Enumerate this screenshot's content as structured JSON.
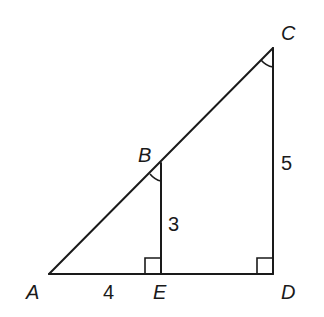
{
  "diagram": {
    "type": "similar-right-triangles",
    "points": {
      "A": {
        "label": "A",
        "x": 49,
        "y": 274
      },
      "E": {
        "label": "E",
        "x": 161,
        "y": 274
      },
      "D": {
        "label": "D",
        "x": 273,
        "y": 274
      },
      "B": {
        "label": "B",
        "x": 161,
        "y": 163
      },
      "C": {
        "label": "C",
        "x": 273,
        "y": 48
      }
    },
    "segments": [
      {
        "from": "A",
        "to": "D"
      },
      {
        "from": "A",
        "to": "C"
      },
      {
        "from": "B",
        "to": "E"
      },
      {
        "from": "C",
        "to": "D"
      }
    ],
    "lengths": {
      "AE": "4",
      "BE": "3",
      "CD": "5"
    },
    "right_angles": [
      "E",
      "D"
    ],
    "congruent_angle_marks": [
      "B",
      "C"
    ],
    "colors": {
      "stroke": "#1a1a1a",
      "background": "#ffffff"
    }
  }
}
